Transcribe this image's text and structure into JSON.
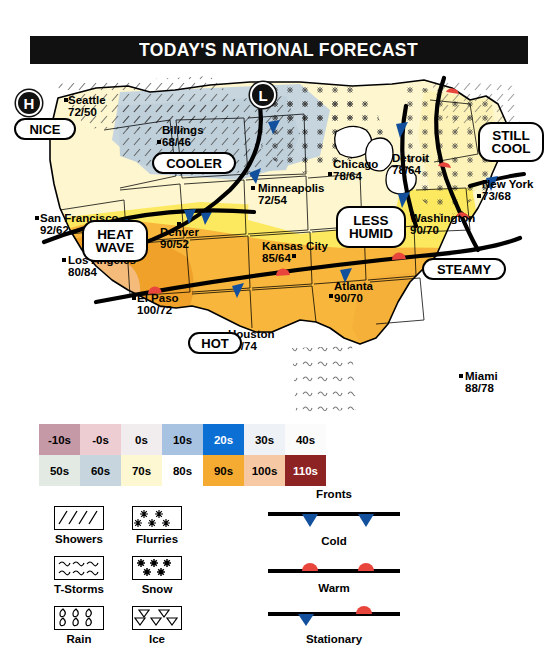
{
  "header": {
    "title": "TODAY'S NATIONAL FORECAST"
  },
  "map": {
    "pressure_markers": [
      {
        "symbol": "H",
        "name": "high-pressure-marker"
      },
      {
        "symbol": "L",
        "name": "low-pressure-marker"
      }
    ],
    "cities": [
      {
        "name": "Seattle",
        "temps": "72/50"
      },
      {
        "name": "Billings",
        "temps": "68/46"
      },
      {
        "name": "Minneapolis",
        "temps": "72/54"
      },
      {
        "name": "Chicago",
        "temps": "78/64"
      },
      {
        "name": "Detroit",
        "temps": "78/64"
      },
      {
        "name": "New York",
        "temps": "73/68"
      },
      {
        "name": "San Francisco",
        "temps": "92/62"
      },
      {
        "name": "Denver",
        "temps": "90/52"
      },
      {
        "name": "Kansas City",
        "temps": "85/64"
      },
      {
        "name": "Washington",
        "temps": "90/70"
      },
      {
        "name": "Los Angeles",
        "temps": "80/84"
      },
      {
        "name": "El Paso",
        "temps": "100/72"
      },
      {
        "name": "Houston",
        "temps": "90/74"
      },
      {
        "name": "Atlanta",
        "temps": "90/70"
      },
      {
        "name": "Miami",
        "temps": "88/78"
      }
    ],
    "callouts": [
      {
        "text": "NICE"
      },
      {
        "text": "COOLER"
      },
      {
        "text": "STILL\nCOOL",
        "line1": "STILL",
        "line2": "COOL"
      },
      {
        "text": "HEAT\nWAVE",
        "line1": "HEAT",
        "line2": "WAVE"
      },
      {
        "text": "LESS\nHUMID",
        "line1": "LESS",
        "line2": "HUMID"
      },
      {
        "text": "STEAMY"
      },
      {
        "text": "HOT"
      }
    ]
  },
  "legend": {
    "temperature": {
      "row1": [
        {
          "label": "-10s",
          "color": "#c59aa6"
        },
        {
          "label": "-0s",
          "color": "#eecdd2"
        },
        {
          "label": "0s",
          "color": "#f1ecee"
        },
        {
          "label": "10s",
          "color": "#a8c2e2"
        },
        {
          "label": "20s",
          "color": "#0c6fd4"
        },
        {
          "label": "30s",
          "color": "#eef1f6"
        },
        {
          "label": "40s",
          "color": "#fbfbfb"
        }
      ],
      "row2": [
        {
          "label": "50s",
          "color": "#e3e9e3"
        },
        {
          "label": "60s",
          "color": "#c6d5de"
        },
        {
          "label": "70s",
          "color": "#fdf7d2"
        },
        {
          "label": "80s",
          "color": "#fce councils"
        },
        {
          "label": "90s",
          "color": "#f5ab32"
        },
        {
          "label": "100s",
          "color": "#f6c9a4"
        },
        {
          "label": "110s",
          "color": "#8e2323"
        }
      ]
    },
    "precipitation": [
      {
        "label": "Showers",
        "icon": "showers-icon"
      },
      {
        "label": "Flurries",
        "icon": "flurries-icon"
      },
      {
        "label": "T-Storms",
        "icon": "tstorms-icon"
      },
      {
        "label": "Snow",
        "icon": "snow-icon"
      },
      {
        "label": "Rain",
        "icon": "rain-icon"
      },
      {
        "label": "Ice",
        "icon": "ice-icon"
      }
    ],
    "fronts": {
      "title": "Fronts",
      "items": [
        {
          "label": "Cold",
          "icon": "cold-front-icon"
        },
        {
          "label": "Warm",
          "icon": "warm-front-icon"
        },
        {
          "label": "Stationary",
          "icon": "stationary-front-icon"
        }
      ]
    }
  },
  "colors": {
    "cold_front": "#12509e",
    "warm_front": "#e8453c",
    "banner_bg": "#111111",
    "land_outline": "#000000"
  }
}
